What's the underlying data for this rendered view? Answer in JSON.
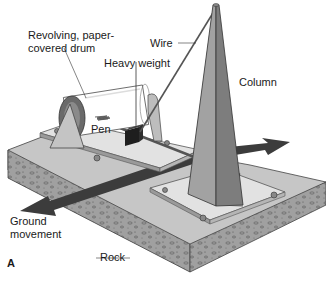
{
  "figure": {
    "panel_letter": "A",
    "labels": {
      "drum": "Revolving, paper-\ncovered drum",
      "wire": "Wire",
      "weight": "Heavy weight",
      "column": "Column",
      "pen": "Pen",
      "ground_movement": "Ground\nmovement",
      "rock": "Rock"
    },
    "colors": {
      "rock_top": "#c9c9c9",
      "rock_side": "#9a9a9a",
      "plate": "#e2e2e2",
      "column_light": "#a8a8a8",
      "column_dark": "#7d7d7d",
      "arrow": "#3c3c3c",
      "weight": "#1e1e1e",
      "drum_end": "#6a6a6a"
    }
  }
}
